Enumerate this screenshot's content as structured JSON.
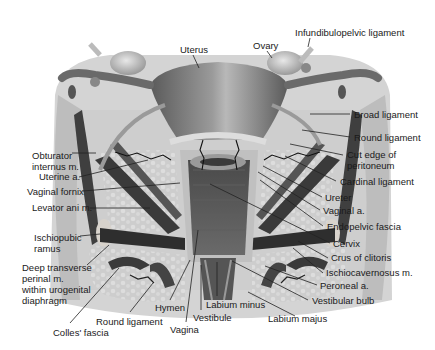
{
  "diagram": {
    "type": "anatomical-illustration",
    "labels": [
      {
        "id": "uterus",
        "text": "Uterus",
        "x": 180,
        "y": 44,
        "lx1": 193,
        "ly1": 55,
        "lx2": 199,
        "ly2": 68
      },
      {
        "id": "ovary",
        "text": "Ovary",
        "x": 253,
        "y": 40,
        "lx1": 267,
        "ly1": 51,
        "lx2": 272,
        "ly2": 58
      },
      {
        "id": "infundibulopelvic-ligament",
        "text": "Infundibulopelvic ligament",
        "x": 295,
        "y": 27,
        "lx1": 310,
        "ly1": 38,
        "lx2": 308,
        "ly2": 47
      },
      {
        "id": "broad-ligament",
        "text": "Broad ligament",
        "x": 354,
        "y": 109,
        "lx1": 310,
        "ly1": 114,
        "lx2": 350,
        "ly2": 114
      },
      {
        "id": "round-ligament-upper",
        "text": "Round ligament",
        "x": 354,
        "y": 132,
        "lx1": 302,
        "ly1": 130,
        "lx2": 350,
        "ly2": 137
      },
      {
        "id": "cut-edge-peritoneum",
        "text": "Cut edge of\nperitoneum",
        "x": 347,
        "y": 149,
        "lx1": 290,
        "ly1": 144,
        "lx2": 343,
        "ly2": 155
      },
      {
        "id": "cardinal-ligament",
        "text": "Cardinal ligament",
        "x": 340,
        "y": 176,
        "lx1": 285,
        "ly1": 156,
        "lx2": 336,
        "ly2": 181
      },
      {
        "id": "ureter",
        "text": "Ureter",
        "x": 325,
        "y": 192,
        "lx1": 263,
        "ly1": 166,
        "lx2": 322,
        "ly2": 197
      },
      {
        "id": "vaginal-a",
        "text": "Vaginal a.",
        "x": 323,
        "y": 205,
        "lx1": 258,
        "ly1": 172,
        "lx2": 320,
        "ly2": 210
      },
      {
        "id": "endopelvic-fascia",
        "text": "Endopelvic fascia",
        "x": 327,
        "y": 221,
        "lx1": 260,
        "ly1": 180,
        "lx2": 323,
        "ly2": 226
      },
      {
        "id": "cervix",
        "text": "Cervix",
        "x": 333,
        "y": 238,
        "lx1": 210,
        "ly1": 184,
        "lx2": 330,
        "ly2": 243
      },
      {
        "id": "crus-of-clitoris",
        "text": "Crus of clitoris",
        "x": 331,
        "y": 252,
        "lx1": 298,
        "ly1": 241,
        "lx2": 328,
        "ly2": 258
      },
      {
        "id": "ischiocavernosus-m",
        "text": "Ischiocavernosus m.",
        "x": 326,
        "y": 267,
        "lx1": 293,
        "ly1": 248,
        "lx2": 323,
        "ly2": 273
      },
      {
        "id": "peroneal-a",
        "text": "Peroneal a.",
        "x": 320,
        "y": 280,
        "lx1": 265,
        "ly1": 266,
        "lx2": 317,
        "ly2": 285
      },
      {
        "id": "vestibular-bulb",
        "text": "Vestibular bulb",
        "x": 312,
        "y": 295,
        "lx1": 232,
        "ly1": 261,
        "lx2": 308,
        "ly2": 300
      },
      {
        "id": "labium-majus",
        "text": "Labium majus",
        "x": 268,
        "y": 313,
        "lx1": 248,
        "ly1": 292,
        "lx2": 295,
        "ly2": 316
      },
      {
        "id": "labium-minus",
        "text": "Labium minus",
        "x": 206,
        "y": 299,
        "lx1": 217,
        "ly1": 262,
        "lx2": 217,
        "ly2": 296
      },
      {
        "id": "vestibule",
        "text": "Vestibule",
        "x": 193,
        "y": 312,
        "lx1": 201,
        "ly1": 265,
        "lx2": 201,
        "ly2": 310
      },
      {
        "id": "vagina",
        "text": "Vagina",
        "x": 170,
        "y": 324,
        "lx1": 198,
        "ly1": 230,
        "lx2": 186,
        "ly2": 322
      },
      {
        "id": "hymen",
        "text": "Hymen",
        "x": 155,
        "y": 302,
        "lx1": 190,
        "ly1": 260,
        "lx2": 170,
        "ly2": 300
      },
      {
        "id": "round-ligament-lower",
        "text": "Round ligament",
        "x": 96,
        "y": 316,
        "lx1": 153,
        "ly1": 283,
        "lx2": 130,
        "ly2": 312
      },
      {
        "id": "colles-fascia",
        "text": "Colles' fascia",
        "x": 53,
        "y": 327,
        "lx1": 119,
        "ly1": 268,
        "lx2": 70,
        "ly2": 323
      },
      {
        "id": "deep-transverse-perineal-m",
        "text": "Deep transverse\nperinal m.\nwithin urogenital\ndiaphragm",
        "x": 22,
        "y": 262,
        "lx1": 87,
        "ly1": 265,
        "lx2": 109,
        "ly2": 245
      },
      {
        "id": "ischiopubic-ramus",
        "text": "Ischiopubic\nramus",
        "x": 34,
        "y": 232,
        "lx1": 80,
        "ly1": 236,
        "lx2": 100,
        "ly2": 234
      },
      {
        "id": "levator-ani-m",
        "text": "Levator ani m.",
        "x": 32,
        "y": 202,
        "lx1": 90,
        "ly1": 208,
        "lx2": 150,
        "ly2": 208
      },
      {
        "id": "vaginal-fornix",
        "text": "Vaginal fornix",
        "x": 27,
        "y": 186,
        "lx1": 83,
        "ly1": 191,
        "lx2": 180,
        "ly2": 183
      },
      {
        "id": "uterine-a",
        "text": "Uterine a.",
        "x": 39,
        "y": 171,
        "lx1": 79,
        "ly1": 177,
        "lx2": 148,
        "ly2": 160
      },
      {
        "id": "obturator-internus-m",
        "text": "Obturator\ninternus m.",
        "x": 32,
        "y": 150,
        "lx1": 72,
        "ly1": 153,
        "lx2": 96,
        "ly2": 153
      }
    ]
  },
  "colors": {
    "background": "#ffffff",
    "tissue_light": "#cfcfcf",
    "tissue_mid": "#a8a8a8",
    "muscle_dark": "#3f3f3f",
    "uterus": "#7d7d7d",
    "text": "#1a1a1a"
  }
}
